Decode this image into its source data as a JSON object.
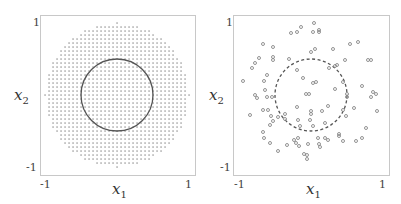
{
  "chart_data": [
    {
      "type": "scatter",
      "title": "",
      "description": "Regular grid of points inside a disk of radius 1, with solid circle of radius 0.5",
      "xlabel": "x1",
      "ylabel": "x2",
      "xlim": [
        -1.05,
        1.05
      ],
      "ylim": [
        -1.1,
        1.1
      ],
      "xticks": [
        "-1",
        "1"
      ],
      "yticks": [
        "1",
        "-1"
      ],
      "grid": false,
      "points": {
        "kind": "grid",
        "spacing": 0.0556,
        "disk_radius": 1.0,
        "marker": "dot",
        "color": "#8a8a8a"
      },
      "boundary_circle": {
        "center": [
          0,
          0
        ],
        "radius": 0.5,
        "style": "solid",
        "color": "#555555"
      }
    },
    {
      "type": "scatter",
      "title": "",
      "description": "Random points with dashed circle of radius 0.5",
      "xlabel": "x1",
      "ylabel": "x2",
      "xlim": [
        -1.05,
        1.05
      ],
      "ylim": [
        -1.1,
        1.1
      ],
      "xticks": [
        "-1",
        "1"
      ],
      "yticks": [
        "1",
        "-1"
      ],
      "grid": false,
      "marker": "open-circle",
      "marker_color": "#888888",
      "boundary_circle": {
        "center": [
          0,
          0
        ],
        "radius": 0.5,
        "style": "dashed",
        "color": "#555555"
      },
      "points_px": [
        [
          314,
          23
        ],
        [
          301,
          27
        ],
        [
          291,
          33
        ],
        [
          297,
          32
        ],
        [
          313,
          32
        ],
        [
          319,
          30
        ],
        [
          319,
          32
        ],
        [
          263,
          44
        ],
        [
          273,
          47
        ],
        [
          350,
          44
        ],
        [
          358,
          42
        ],
        [
          315,
          49
        ],
        [
          311,
          52
        ],
        [
          333,
          49
        ],
        [
          259,
          58
        ],
        [
          273,
          57
        ],
        [
          273,
          60
        ],
        [
          289,
          59
        ],
        [
          255,
          63
        ],
        [
          252,
          68
        ],
        [
          345,
          60
        ],
        [
          368,
          60
        ],
        [
          371,
          60
        ],
        [
          329,
          68
        ],
        [
          335,
          66
        ],
        [
          337,
          65
        ],
        [
          297,
          70
        ],
        [
          267,
          75
        ],
        [
          264,
          81
        ],
        [
          243,
          81
        ],
        [
          303,
          78
        ],
        [
          313,
          83
        ],
        [
          316,
          82
        ],
        [
          343,
          82
        ],
        [
          362,
          86
        ],
        [
          265,
          90
        ],
        [
          255,
          95
        ],
        [
          257,
          98
        ],
        [
          267,
          97
        ],
        [
          272,
          97
        ],
        [
          306,
          94
        ],
        [
          309,
          94
        ],
        [
          335,
          89
        ],
        [
          347,
          94
        ],
        [
          347,
          97
        ],
        [
          373,
          92
        ],
        [
          376,
          94
        ],
        [
          371,
          97
        ],
        [
          250,
          115
        ],
        [
          263,
          110
        ],
        [
          268,
          110
        ],
        [
          271,
          116
        ],
        [
          278,
          117
        ],
        [
          285,
          114
        ],
        [
          297,
          107
        ],
        [
          311,
          111
        ],
        [
          311,
          114
        ],
        [
          322,
          111
        ],
        [
          328,
          106
        ],
        [
          343,
          110
        ],
        [
          346,
          116
        ],
        [
          354,
          108
        ],
        [
          377,
          111
        ],
        [
          270,
          125
        ],
        [
          273,
          121
        ],
        [
          285,
          119
        ],
        [
          298,
          120
        ],
        [
          300,
          126
        ],
        [
          313,
          126
        ],
        [
          310,
          120
        ],
        [
          325,
          123
        ],
        [
          263,
          132
        ],
        [
          264,
          138
        ],
        [
          270,
          143
        ],
        [
          278,
          151
        ],
        [
          287,
          145
        ],
        [
          294,
          140
        ],
        [
          296,
          143
        ],
        [
          299,
          146
        ],
        [
          298,
          138
        ],
        [
          308,
          144
        ],
        [
          318,
          138
        ],
        [
          319,
          144
        ],
        [
          320,
          147
        ],
        [
          325,
          138
        ],
        [
          328,
          140
        ],
        [
          339,
          134
        ],
        [
          339,
          136
        ],
        [
          343,
          141
        ],
        [
          356,
          141
        ],
        [
          362,
          138
        ],
        [
          366,
          128
        ],
        [
          304,
          154
        ],
        [
          307,
          155
        ],
        [
          307,
          159
        ]
      ]
    }
  ],
  "panels": [
    {
      "frame": {
        "left": 40,
        "top": 15,
        "right": 195,
        "bottom": 175
      },
      "center_px": [
        117,
        95
      ],
      "unit_px": 72,
      "ticks": {
        "x_neg": "-1",
        "x_pos": "1",
        "y_pos": "1",
        "y_neg": "-1"
      },
      "xlabel": "x",
      "xlabel_sub": "1",
      "ylabel": "x",
      "ylabel_sub": "2"
    },
    {
      "frame": {
        "left": 233,
        "top": 15,
        "right": 389,
        "bottom": 175
      },
      "center_px": [
        311,
        95
      ],
      "unit_px": 72,
      "ticks": {
        "x_neg": "-1",
        "x_pos": "1",
        "y_pos": "1",
        "y_neg": "-1"
      },
      "xlabel": "x",
      "xlabel_sub": "1",
      "ylabel": "x",
      "ylabel_sub": "2"
    }
  ]
}
